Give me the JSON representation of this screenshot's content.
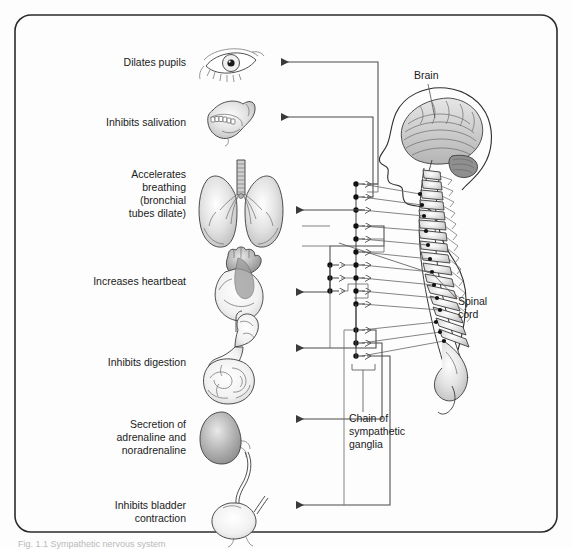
{
  "figure": {
    "background_color": "#fdfdfd",
    "panel_color": "#ffffff",
    "frame_color": "#2b2b2b",
    "caption": "Fig. 1.1 Sympathetic nervous system"
  },
  "left_labels": [
    {
      "id": "pupils",
      "text": "Dilates pupils",
      "lines": [
        "Dilates pupils"
      ]
    },
    {
      "id": "salivation",
      "text": "Inhibits salivation",
      "lines": [
        "Inhibits salivation"
      ]
    },
    {
      "id": "breathing",
      "text": "Accelerates breathing (bronchial tubes dilate)",
      "lines": [
        "Accelerates",
        "breathing",
        "(bronchial",
        "tubes dilate)"
      ]
    },
    {
      "id": "heartbeat",
      "text": "Increases heartbeat",
      "lines": [
        "Increases heartbeat"
      ]
    },
    {
      "id": "digestion",
      "text": "Inhibits digestion",
      "lines": [
        "Inhibits digestion"
      ]
    },
    {
      "id": "adrenaline",
      "text": "Secretion of adrenaline and noradrenaline",
      "lines": [
        "Secretion of",
        "adrenaline and",
        "noradrenaline"
      ]
    },
    {
      "id": "bladder",
      "text": "Inhibits bladder contraction",
      "lines": [
        "Inhibits bladder",
        "contraction"
      ]
    }
  ],
  "right_labels": [
    {
      "id": "brain",
      "text": "Brain",
      "lines": [
        "Brain"
      ]
    },
    {
      "id": "spinal",
      "text": "Spinal cord",
      "lines": [
        "Spinal",
        "cord"
      ]
    },
    {
      "id": "ganglia",
      "text": "Chain of sympathetic ganglia",
      "lines": [
        "Chain of",
        "sympathetic",
        "ganglia"
      ]
    }
  ],
  "organs": [
    {
      "id": "eye",
      "name": "eye-illustration"
    },
    {
      "id": "jaw",
      "name": "salivary-gland-jaw-illustration"
    },
    {
      "id": "lungs",
      "name": "lungs-illustration"
    },
    {
      "id": "heart",
      "name": "heart-illustration"
    },
    {
      "id": "stomach",
      "name": "stomach-intestines-illustration"
    },
    {
      "id": "adrenal",
      "name": "adrenal-gland-illustration"
    },
    {
      "id": "bladder",
      "name": "bladder-illustration"
    }
  ],
  "anatomy": {
    "head": "human-head-profile",
    "brain": "brain-illustration",
    "vertebral_column": "vertebral-column-illustration",
    "ganglion_chain_count": 14
  }
}
